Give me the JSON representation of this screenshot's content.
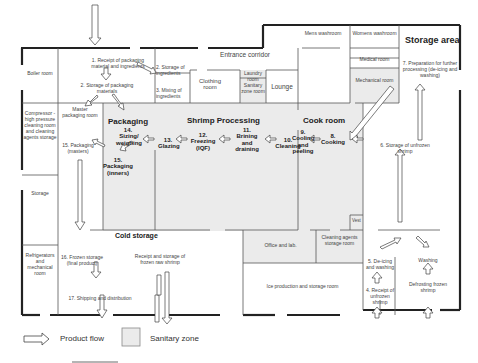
{
  "diagram": {
    "type": "floor-plan"
  },
  "areas": {
    "storage_area": "Storage area",
    "packaging": "Packaging",
    "shrimp_processing": "Shrimp Processing",
    "cook_room": "Cook room",
    "cold_storage": "Cold storage"
  },
  "rooms": {
    "entrance_corridor": "Entrance corridor",
    "mens_washroom": "Mens washroom",
    "womens_washroom": "Womens washroom",
    "medical_room": "Medical room",
    "mechanical_room": "Mechanical room",
    "boiler_room": "Boiler room",
    "compressor_room": "Compressor - high pressure cleaning room and cleaning agents storage",
    "master_packaging_room": "Master packaging room",
    "storage": "Storage",
    "refrigerators_room": "Refrigerators and mechanical room",
    "clothing_room": "Clothing room",
    "laundry_room": "Laundry room",
    "sanitary_zone_room": "Sanitary zone room",
    "lounge": "Lounge",
    "office_lab": "Office and lab.",
    "cleaning_agents_room": "Cleaning agents storage room",
    "ice_room": "Ice production and storage room",
    "vest": "Vest"
  },
  "steps": {
    "s1": "1. Receipt of packaging material and ingredients",
    "s2a": "2. Storage of packaging materials",
    "s2b": "2. Storage of ingredients",
    "s3": "3. Mixing of ingredients",
    "s4": "4. Receipt of unfrozen shrimp",
    "s5": "5. De-icing and washing",
    "s6": "6. Storage of unfrozen shrimp",
    "s7": "7. Preparation for further processing (de-icing and washing)",
    "s8_num": "8.",
    "s8": "Cooking",
    "s9_num": "9.",
    "s9": "Cooling and peeling",
    "s10_num": "10.",
    "s10": "Cleaning",
    "s11_num": "11.",
    "s11": "Brining and draining",
    "s12_num": "12.",
    "s12": "Freezing (IQF)",
    "s13_num": "13.",
    "s13": "Glazing",
    "s14_num": "14.",
    "s14": "Sizing/ weighing",
    "s15a_num": "15.",
    "s15a": "Packaging (inners)",
    "s15b": "15. Packaging (masters)",
    "s16": "16. Frozen storage (final product)",
    "s17": "17. Shipping and distribution",
    "washing": "Washing",
    "defrosting": "Defrosting frozen shrimp",
    "receipt_frozen": "Receipt and storage of frozen raw shrimp"
  },
  "legend": {
    "product_flow": "Product flow",
    "sanitary_zone": "Sanitary zone"
  },
  "colors": {
    "sanitary_zone_fill": "#ebebeb",
    "wall": "#222222",
    "thin_wall": "#555555"
  }
}
